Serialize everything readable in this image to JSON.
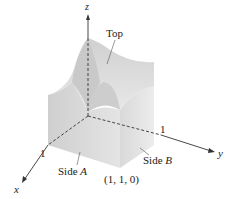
{
  "figure": {
    "axes": {
      "x": "x",
      "y": "y",
      "z": "z"
    },
    "ticks": {
      "x_one": "1",
      "y_one": "1"
    },
    "labels": {
      "top": "Top",
      "side_a_prefix": "Side ",
      "side_a_letter": "A",
      "side_b_prefix": "Side ",
      "side_b_letter": "B",
      "corner_point": "(1, 1, 0)"
    },
    "colors": {
      "surface_light": "#e6e6e6",
      "surface_mid": "#d4d4d4",
      "surface_dark": "#c2c2c2",
      "axis": "#333333"
    }
  }
}
